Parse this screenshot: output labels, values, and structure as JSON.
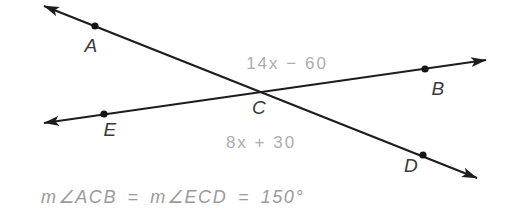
{
  "diagram": {
    "background_color": "#ffffff",
    "line_color": "#1d1d1d",
    "dot_color": "#141414",
    "label_color": "#3a3a3a",
    "expression_color": "#adadad",
    "equation_color": "#9b9b9b",
    "lines": [
      {
        "name": "line-through-A-C-D",
        "x1": 44,
        "y1": 6,
        "x2": 477,
        "y2": 178
      },
      {
        "name": "line-through-E-C-B",
        "x1": 44,
        "y1": 123,
        "x2": 486,
        "y2": 60
      }
    ],
    "points": [
      {
        "label": "A",
        "dot": true,
        "x": 95,
        "y": 26,
        "label_x": 91,
        "label_y": 52
      },
      {
        "label": "B",
        "dot": true,
        "x": 425,
        "y": 69,
        "label_x": 438,
        "label_y": 95
      },
      {
        "label": "C",
        "dot": false,
        "x": 262,
        "y": 92,
        "label_x": 259,
        "label_y": 114
      },
      {
        "label": "D",
        "dot": true,
        "x": 423,
        "y": 155,
        "label_x": 411,
        "label_y": 172
      },
      {
        "label": "E",
        "dot": true,
        "x": 104,
        "y": 114,
        "label_x": 110,
        "label_y": 136
      }
    ],
    "angle_expressions": [
      {
        "name": "angle-ACB-expression",
        "text": "14x − 60",
        "x": 287,
        "y": 69
      },
      {
        "name": "angle-ECD-expression",
        "text": "8x + 30",
        "x": 261,
        "y": 148
      }
    ],
    "equation": "m∠ACB = m∠ECD = 150°"
  }
}
